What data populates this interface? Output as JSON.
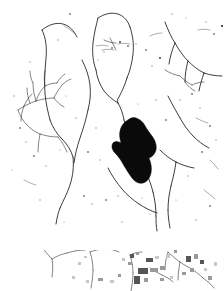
{
  "document": {
    "kind": "scanned-binarized-line-drawing",
    "title": "Drainage network line map",
    "width": 224,
    "height": 291,
    "background_color": "#ffffff",
    "ink_color": "#1a1a1a",
    "blob_color": "#0a0a0a",
    "artifact_color": "#9a9a9a",
    "caption": "Binarized scan of a drainage network map: thin branching channel traces on white ground, one solid filled elongated region near center, scattered speckle noise, and a lower detached strip containing additional traces with gray compression-artifact blocks."
  },
  "panels": [
    {
      "name": "main-panel",
      "label": "Main line-work panel",
      "bounds": {
        "x": 0,
        "y": 0,
        "width": 224,
        "height": 232
      }
    },
    {
      "name": "separator-band",
      "label": "Blank separator band",
      "bounds": {
        "x": 0,
        "y": 232,
        "width": 224,
        "height": 18
      }
    },
    {
      "name": "lower-strip",
      "label": "Lower detached strip",
      "bounds": {
        "x": 0,
        "y": 250,
        "width": 224,
        "height": 41
      }
    }
  ],
  "features": {
    "dendritic_cluster_label": "Dendritic branching cluster (left-middle)",
    "closed_lobe_label": "Closed lobe outline (upper center)",
    "filled_region_label": "Solid filled elongated region (center)",
    "junction_label": "Channel junction",
    "branch_fan_label": "Branch fan (upper right)"
  },
  "traces": {
    "main": [
      "M 42 30 C 46 38 47 48 46 58 C 45 70 44 82 45 94 C 46 104 48 112 50 120",
      "M 42 30 C 48 25 56 22 63 24 C 70 26 74 31 77 37",
      "M 50 120 C 53 128 57 134 62 139 C 67 144 71 150 73 157",
      "M 73 157 C 74 166 73 176 70 185 C 67 194 63 201 60 208",
      "M 60 208 C 58 213 57 218 56 224",
      "M 82 60 C 86 68 89 76 90 85 C 91 94 90 102 88 110",
      "M 88 110 C 86 120 83 129 80 138 C 77 147 75 155 74 163",
      "M 98 18 C 96 26 94 34 93 43 C 92 53 93 62 96 70",
      "M 98 18 C 104 14 111 12 118 14 C 124 16 128 21 130 27",
      "M 130 27 C 133 36 134 45 133 54 C 132 63 130 71 127 78",
      "M 96 70 C 97 78 100 85 104 91 C 108 96 113 100 118 103",
      "M 127 78 C 125 85 122 91 119 97 C 117 100 117 101 118 103",
      "M 118 103 C 121 108 123 114 124 120",
      "M 124 120 C 126 128 129 136 132 144",
      "M 132 144 C 136 153 140 161 144 168",
      "M 144 168 C 148 176 151 184 153 192",
      "M 153 192 C 155 200 156 208 156 216",
      "M 156 216 C 156 221 156 226 157 231",
      "M 165 22 C 168 30 171 37 175 43",
      "M 175 43 C 179 50 183 56 188 61",
      "M 188 61 C 193 66 198 70 204 73",
      "M 175 43 C 172 50 170 57 169 64",
      "M 188 61 C 186 68 185 75 185 82",
      "M 204 73 C 210 75 216 76 222 76",
      "M 204 73 C 202 79 200 85 199 91",
      "M 168 96 C 172 104 176 111 180 118",
      "M 180 118 C 184 125 188 131 193 136",
      "M 193 136 C 198 141 203 145 209 148",
      "M 160 150 C 165 155 170 159 176 162",
      "M 176 162 C 182 165 188 167 194 168",
      "M 176 162 C 175 170 173 178 171 186",
      "M 171 186 C 169 194 168 202 168 210",
      "M 168 210 C 168 216 169 222 170 228",
      "M 108 168 C 112 176 117 183 122 189",
      "M 122 189 C 127 195 133 200 139 204",
      "M 139 204 C 145 208 151 211 157 213"
    ],
    "fine": [
      "M 18 110 C 24 106 30 103 36 101 C 42 99 48 98 54 98",
      "M 36 101 C 34 95 33 89 33 83",
      "M 36 101 C 38 95 41 90 45 86",
      "M 45 86 C 44 81 44 76 45 71",
      "M 45 86 C 49 84 53 83 57 83",
      "M 54 98 C 56 93 59 89 62 85",
      "M 54 98 C 57 102 60 105 64 107",
      "M 24 106 C 22 111 21 116 21 121",
      "M 24 106 C 26 101 29 97 32 94",
      "M 18 110 C 20 116 23 121 27 125",
      "M 27 125 C 31 129 35 132 40 134",
      "M 40 134 C 46 136 52 137 58 137",
      "M 30 103 C 28 98 27 93 27 88",
      "M 57 83 C 59 79 62 76 65 74",
      "M 62 85 C 65 82 68 80 71 79",
      "M 33 83 C 31 79 30 75 30 71",
      "M 40 134 C 39 140 38 146 38 152",
      "M 58 137 C 62 142 65 147 67 152",
      "M 104 40 C 108 42 112 43 116 43",
      "M 110 38 C 112 42 114 46 116 50",
      "M 165 70 C 170 73 175 75 180 76",
      "M 180 76 C 184 80 188 83 192 85",
      "M 192 85 C 196 83 200 82 204 82",
      "M 185 82 C 188 86 191 89 195 91",
      "M 40 244 C 44 250 48 255 52 259",
      "M 52 259 C 53 265 53 271 52 277",
      "M 52 259 C 57 256 62 254 67 253",
      "M 67 253 C 73 251 79 250 85 250",
      "M 90 252 C 92 258 93 264 93 270",
      "M 93 270 C 93 276 92 282 91 288",
      "M 90 252 C 95 250 100 249 105 249",
      "M 105 249 C 110 249 115 250 119 252",
      "M 130 255 C 132 261 133 267 133 273",
      "M 133 273 C 133 279 132 285 131 291",
      "M 130 255 C 134 253 138 252 142 252",
      "M 168 252 C 172 256 176 259 180 262",
      "M 180 262 C 184 265 188 267 192 269",
      "M 168 252 C 166 258 165 264 165 270",
      "M 180 262 C 179 268 178 274 178 280",
      "M 192 269 C 196 272 200 275 203 278",
      "M 203 278 C 207 281 211 284 214 288",
      "M 150 268 C 154 271 158 273 162 275",
      "M 162 275 C 166 277 170 279 173 282"
    ],
    "faint": [
      "M 96 46 C 100 45 104 45 108 46",
      "M 102 50 C 106 49 110 49 114 50",
      "M 118 44 C 122 43 126 43 130 44",
      "M 150 36 C 154 34 158 33 162 33",
      "M 198 30 C 202 29 206 29 210 30",
      "M 24 180 C 28 182 32 184 36 185",
      "M 196 118 C 200 120 204 122 208 123",
      "M 210 160 C 213 163 216 166 218 169",
      "M 64 26 C 68 28 72 31 75 34",
      "M 204 190 C 208 193 212 196 215 199"
    ]
  },
  "filled_region": {
    "name": "solid-blob",
    "path": "M 128 120 C 124 122 121 126 120 131 C 119 135 120 139 121 143 C 118 141 115 141 113 143 C 111 146 112 150 115 153 C 118 156 121 160 123 164 C 126 169 129 174 132 178 C 135 182 139 184 143 183 C 147 182 150 178 151 173 C 152 168 151 163 149 158 C 152 157 155 154 156 150 C 157 145 155 140 152 136 C 149 132 146 128 144 124 C 142 121 139 119 136 118 C 133 117 130 118 128 120 Z",
    "approx_bounds": {
      "x": 112,
      "y": 117,
      "width": 45,
      "height": 67
    }
  },
  "specks": [
    {
      "x": 222,
      "y": 26,
      "r": 1.1
    },
    {
      "x": 214,
      "y": 34,
      "r": 0.8
    },
    {
      "x": 206,
      "y": 22,
      "r": 0.7
    },
    {
      "x": 160,
      "y": 58,
      "r": 0.9
    },
    {
      "x": 152,
      "y": 66,
      "r": 0.7
    },
    {
      "x": 146,
      "y": 50,
      "r": 0.8
    },
    {
      "x": 120,
      "y": 42,
      "r": 0.9
    },
    {
      "x": 112,
      "y": 48,
      "r": 0.8
    },
    {
      "x": 104,
      "y": 52,
      "r": 0.7
    },
    {
      "x": 128,
      "y": 46,
      "r": 0.8
    },
    {
      "x": 136,
      "y": 44,
      "r": 0.7
    },
    {
      "x": 98,
      "y": 60,
      "r": 0.6
    },
    {
      "x": 70,
      "y": 14,
      "r": 0.8
    },
    {
      "x": 58,
      "y": 40,
      "r": 0.7
    },
    {
      "x": 30,
      "y": 62,
      "r": 0.7
    },
    {
      "x": 20,
      "y": 128,
      "r": 0.8
    },
    {
      "x": 26,
      "y": 142,
      "r": 0.7
    },
    {
      "x": 34,
      "y": 156,
      "r": 0.8
    },
    {
      "x": 46,
      "y": 166,
      "r": 0.7
    },
    {
      "x": 60,
      "y": 150,
      "r": 0.6
    },
    {
      "x": 76,
      "y": 118,
      "r": 0.7
    },
    {
      "x": 88,
      "y": 152,
      "r": 0.8
    },
    {
      "x": 100,
      "y": 160,
      "r": 0.7
    },
    {
      "x": 84,
      "y": 196,
      "r": 0.8
    },
    {
      "x": 92,
      "y": 204,
      "r": 0.7
    },
    {
      "x": 106,
      "y": 200,
      "r": 0.8
    },
    {
      "x": 118,
      "y": 196,
      "r": 0.7
    },
    {
      "x": 142,
      "y": 198,
      "r": 0.6
    },
    {
      "x": 166,
      "y": 120,
      "r": 0.8
    },
    {
      "x": 180,
      "y": 100,
      "r": 0.7
    },
    {
      "x": 192,
      "y": 94,
      "r": 0.8
    },
    {
      "x": 200,
      "y": 108,
      "r": 0.7
    },
    {
      "x": 210,
      "y": 126,
      "r": 0.8
    },
    {
      "x": 216,
      "y": 140,
      "r": 0.7
    },
    {
      "x": 202,
      "y": 152,
      "r": 0.8
    },
    {
      "x": 188,
      "y": 176,
      "r": 0.7
    },
    {
      "x": 176,
      "y": 200,
      "r": 0.6
    },
    {
      "x": 210,
      "y": 206,
      "r": 0.8
    },
    {
      "x": 196,
      "y": 220,
      "r": 0.7
    },
    {
      "x": 150,
      "y": 214,
      "r": 0.6
    },
    {
      "x": 122,
      "y": 222,
      "r": 0.7
    },
    {
      "x": 64,
      "y": 222,
      "r": 0.6
    },
    {
      "x": 40,
      "y": 200,
      "r": 0.7
    },
    {
      "x": 14,
      "y": 96,
      "r": 0.7
    },
    {
      "x": 12,
      "y": 170,
      "r": 0.6
    },
    {
      "x": 172,
      "y": 14,
      "r": 0.7
    },
    {
      "x": 186,
      "y": 18,
      "r": 0.6
    },
    {
      "x": 156,
      "y": 100,
      "r": 0.7
    },
    {
      "x": 138,
      "y": 104,
      "r": 0.6
    },
    {
      "x": 96,
      "y": 128,
      "r": 0.7
    },
    {
      "x": 66,
      "y": 96,
      "r": 0.6
    }
  ],
  "artifact_blocks": [
    {
      "x": 130,
      "y": 254,
      "w": 4,
      "h": 4,
      "tone": "dark"
    },
    {
      "x": 136,
      "y": 252,
      "w": 3,
      "h": 3,
      "tone": "mid"
    },
    {
      "x": 128,
      "y": 262,
      "w": 4,
      "h": 3,
      "tone": "mid"
    },
    {
      "x": 146,
      "y": 258,
      "w": 7,
      "h": 4,
      "tone": "dark"
    },
    {
      "x": 155,
      "y": 256,
      "w": 4,
      "h": 3,
      "tone": "light"
    },
    {
      "x": 138,
      "y": 268,
      "w": 10,
      "h": 6,
      "tone": "dark"
    },
    {
      "x": 150,
      "y": 268,
      "w": 8,
      "h": 4,
      "tone": "mid"
    },
    {
      "x": 160,
      "y": 266,
      "w": 5,
      "h": 4,
      "tone": "mid"
    },
    {
      "x": 134,
      "y": 276,
      "w": 6,
      "h": 8,
      "tone": "dark"
    },
    {
      "x": 144,
      "y": 278,
      "w": 4,
      "h": 4,
      "tone": "mid"
    },
    {
      "x": 166,
      "y": 254,
      "w": 4,
      "h": 4,
      "tone": "light"
    },
    {
      "x": 174,
      "y": 250,
      "w": 3,
      "h": 3,
      "tone": "mid"
    },
    {
      "x": 186,
      "y": 256,
      "w": 5,
      "h": 6,
      "tone": "dark"
    },
    {
      "x": 194,
      "y": 254,
      "w": 4,
      "h": 5,
      "tone": "mid"
    },
    {
      "x": 200,
      "y": 260,
      "w": 4,
      "h": 4,
      "tone": "dark"
    },
    {
      "x": 190,
      "y": 268,
      "w": 4,
      "h": 4,
      "tone": "mid"
    },
    {
      "x": 204,
      "y": 268,
      "w": 3,
      "h": 3,
      "tone": "light"
    },
    {
      "x": 182,
      "y": 272,
      "w": 4,
      "h": 3,
      "tone": "mid"
    },
    {
      "x": 118,
      "y": 274,
      "w": 3,
      "h": 3,
      "tone": "mid"
    },
    {
      "x": 110,
      "y": 280,
      "w": 4,
      "h": 3,
      "tone": "light"
    },
    {
      "x": 98,
      "y": 278,
      "w": 5,
      "h": 3,
      "tone": "mid"
    },
    {
      "x": 86,
      "y": 280,
      "w": 3,
      "h": 3,
      "tone": "light"
    },
    {
      "x": 72,
      "y": 276,
      "w": 3,
      "h": 3,
      "tone": "light"
    },
    {
      "x": 78,
      "y": 262,
      "w": 3,
      "h": 3,
      "tone": "light"
    },
    {
      "x": 84,
      "y": 256,
      "w": 3,
      "h": 2,
      "tone": "light"
    },
    {
      "x": 122,
      "y": 258,
      "w": 3,
      "h": 3,
      "tone": "light"
    },
    {
      "x": 160,
      "y": 278,
      "w": 4,
      "h": 3,
      "tone": "mid"
    },
    {
      "x": 170,
      "y": 276,
      "w": 3,
      "h": 3,
      "tone": "light"
    },
    {
      "x": 208,
      "y": 276,
      "w": 4,
      "h": 4,
      "tone": "mid"
    },
    {
      "x": 214,
      "y": 262,
      "w": 3,
      "h": 4,
      "tone": "light"
    }
  ]
}
